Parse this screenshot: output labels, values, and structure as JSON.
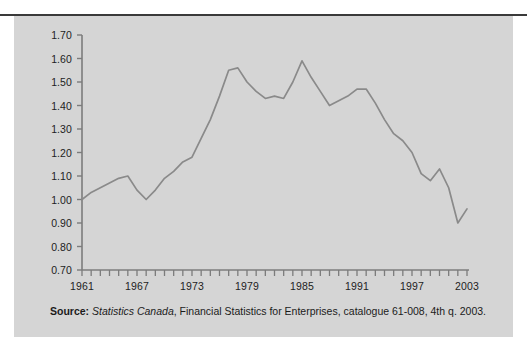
{
  "figure": {
    "background_color": "#d5d5d5",
    "page_color": "#ffffff",
    "rule_color": "#3a3a3a",
    "line_color": "#8a8a8a",
    "axis_color": "#7c7c7c",
    "text_color": "#1d1d1d"
  },
  "source": {
    "label": "Source:",
    "publisher": "Statistics Canada",
    "rest": ", Financial Statistics for Enterprises, catalogue 61-008, 4th q. 2003."
  },
  "chart_data": {
    "type": "line",
    "title": "",
    "subtitle": "",
    "xlabel": "",
    "ylabel": "",
    "xlim": [
      1961,
      2003
    ],
    "ylim": [
      0.7,
      1.7
    ],
    "grid": false,
    "legend": false,
    "legend_position": "none",
    "y_ticks": [
      0.7,
      0.8,
      0.9,
      1.0,
      1.1,
      1.2,
      1.3,
      1.4,
      1.5,
      1.6,
      1.7
    ],
    "y_tick_labels": [
      "0.70",
      "0.80",
      "0.90",
      "1.00",
      "1.10",
      "1.20",
      "1.30",
      "1.40",
      "1.50",
      "1.60",
      "1.70"
    ],
    "x_ticks_minor_step": 1,
    "x_tick_labels": [
      "1961",
      "1967",
      "1973",
      "1979",
      "1985",
      "1991",
      "1997",
      "2003"
    ],
    "x_tick_label_values": [
      1961,
      1967,
      1973,
      1979,
      1985,
      1991,
      1997,
      2003
    ],
    "series": [
      {
        "name": "Debt-to-equity ratio",
        "x": [
          1961,
          1962,
          1963,
          1964,
          1965,
          1966,
          1967,
          1968,
          1969,
          1970,
          1971,
          1972,
          1973,
          1974,
          1975,
          1976,
          1977,
          1978,
          1979,
          1980,
          1981,
          1982,
          1983,
          1984,
          1985,
          1986,
          1987,
          1988,
          1989,
          1990,
          1991,
          1992,
          1993,
          1994,
          1995,
          1996,
          1997,
          1998,
          1999,
          2000,
          2001,
          2002,
          2003
        ],
        "values": [
          1.0,
          1.03,
          1.05,
          1.07,
          1.09,
          1.1,
          1.04,
          1.0,
          1.04,
          1.09,
          1.12,
          1.16,
          1.18,
          1.26,
          1.34,
          1.44,
          1.55,
          1.56,
          1.5,
          1.46,
          1.43,
          1.44,
          1.43,
          1.5,
          1.59,
          1.52,
          1.46,
          1.4,
          1.42,
          1.44,
          1.47,
          1.47,
          1.41,
          1.34,
          1.28,
          1.25,
          1.2,
          1.11,
          1.08,
          1.13,
          1.05,
          0.9,
          0.96
        ]
      }
    ]
  }
}
